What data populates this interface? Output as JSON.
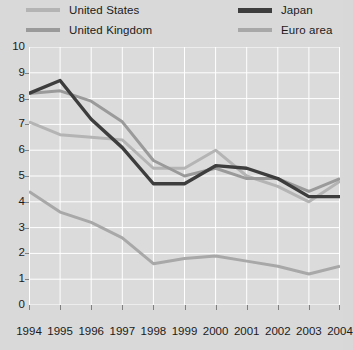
{
  "chart_data": {
    "type": "line",
    "title": "",
    "xlabel": "",
    "ylabel": "",
    "categories": [
      "1994",
      "1995",
      "1996",
      "1997",
      "1998",
      "1999",
      "2000",
      "2001",
      "2002",
      "2003",
      "2004"
    ],
    "x": [
      1994,
      1995,
      1996,
      1997,
      1998,
      1999,
      2000,
      2001,
      2002,
      2003,
      2004
    ],
    "ylim": [
      0,
      10
    ],
    "yticks": [
      0,
      1,
      2,
      3,
      4,
      5,
      6,
      7,
      8,
      9,
      10
    ],
    "ytick_labels": [
      "0",
      "1",
      "2",
      "3",
      "4",
      "5",
      "6",
      "7",
      "8",
      "9",
      "10"
    ],
    "grid": true,
    "legend_position": "top",
    "series": [
      {
        "name": "United States",
        "color": "#b4b4b4",
        "values": [
          7.1,
          6.6,
          6.5,
          6.4,
          5.3,
          5.3,
          6.0,
          5.0,
          4.6,
          4.0,
          4.8
        ]
      },
      {
        "name": "United Kingdom",
        "color": "#9a9a9a",
        "values": [
          8.2,
          8.3,
          7.9,
          7.1,
          5.6,
          5.0,
          5.3,
          4.9,
          4.9,
          4.4,
          4.9
        ]
      },
      {
        "name": "Japan",
        "color": "#3d3d3d",
        "values": [
          8.2,
          8.7,
          7.2,
          6.1,
          4.7,
          4.7,
          5.4,
          5.3,
          4.9,
          4.2,
          4.2
        ]
      },
      {
        "name": "Euro area",
        "color": "#a8a8a8",
        "values": [
          4.4,
          3.6,
          3.2,
          2.6,
          1.6,
          1.8,
          1.9,
          1.7,
          1.5,
          1.2,
          1.5
        ]
      }
    ]
  },
  "legend": {
    "items": [
      {
        "label": "United States"
      },
      {
        "label": "United Kingdom"
      },
      {
        "label": "Japan"
      },
      {
        "label": "Euro area"
      }
    ]
  },
  "colors": {
    "plot_background": "#dbdbdb",
    "page_background": "#d9d9d9",
    "gridline": "#ffffff",
    "text": "#1b1b1b",
    "tick": "#808080"
  }
}
